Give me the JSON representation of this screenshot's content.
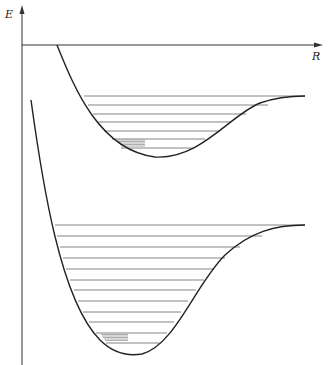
{
  "axes": {
    "y_label": "E",
    "x_label": "R",
    "axis_color": "#333333"
  },
  "curves": [
    {
      "name": "excited-state-potential",
      "minimum": {
        "x": 155,
        "y": 157
      },
      "asymptote_y": 96,
      "vibrational_levels_y": [
        96,
        105,
        114,
        122,
        131,
        139,
        148
      ],
      "shaded_high_density_level_y": 141
    },
    {
      "name": "ground-state-potential",
      "minimum": {
        "x": 135,
        "y": 355
      },
      "asymptote_y": 225,
      "vibrational_levels_y": [
        225,
        236,
        247,
        258,
        269,
        280,
        290,
        301,
        312,
        322,
        333,
        343
      ],
      "shaded_high_density_level_y": 337
    }
  ],
  "colors": {
    "curve": "#222222",
    "level": "#666666",
    "shaded": "#999999"
  }
}
